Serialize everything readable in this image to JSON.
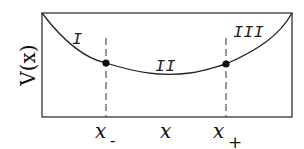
{
  "diagram": {
    "ylabel": "V(x)",
    "regions": [
      {
        "label": "I",
        "x": 92,
        "y": 38
      },
      {
        "label": "II",
        "x": 170,
        "y": 66
      },
      {
        "label": "III",
        "x": 252,
        "y": 38
      }
    ],
    "xlabels": {
      "x_minus_base": "x",
      "x_minus_sub": "-",
      "x_center": "x",
      "x_plus_base": "x",
      "x_plus_sub": "+"
    },
    "turning_points": [
      {
        "name": "x-",
        "x": 106,
        "y": 63
      },
      {
        "name": "x+",
        "x": 226,
        "y": 64
      }
    ],
    "colors": {
      "stroke": "#222222",
      "dash": "#444444"
    }
  }
}
